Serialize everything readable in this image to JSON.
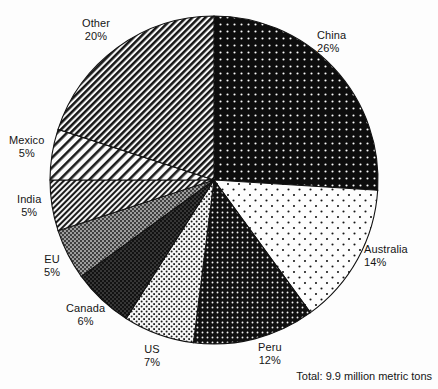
{
  "chart_data": {
    "type": "pie",
    "title": "",
    "subtitle": "",
    "xlabel": "",
    "ylabel": "",
    "legend_position": "none",
    "grid": false,
    "units": "percent of world total",
    "total_annotation": "Total: 9.9 million metric tons",
    "start_angle_deg": 0,
    "direction": "clockwise",
    "categories": [
      "China",
      "Australia",
      "Peru",
      "US",
      "Canada",
      "EU",
      "India",
      "Mexico",
      "Other"
    ],
    "values": [
      26,
      14,
      12,
      7,
      6,
      5,
      5,
      5,
      20
    ],
    "slices": [
      {
        "label": "China",
        "percent": 26,
        "percent_text": "26%",
        "fill": "black-dotted",
        "label_align": "left",
        "label_left": 317,
        "label_top": 29
      },
      {
        "label": "Australia",
        "percent": 14,
        "percent_text": "14%",
        "fill": "white-sparse-dotted",
        "label_align": "left",
        "label_left": 364,
        "label_top": 243
      },
      {
        "label": "Peru",
        "percent": 12,
        "percent_text": "12%",
        "fill": "black-dense-dotted",
        "label_align": "center",
        "label_left": 258,
        "label_top": 341
      },
      {
        "label": "US",
        "percent": 7,
        "percent_text": "7%",
        "fill": "light-dotted",
        "label_align": "center",
        "label_left": 144,
        "label_top": 343
      },
      {
        "label": "Canada",
        "percent": 6,
        "percent_text": "6%",
        "fill": "dark-crosshatch",
        "label_align": "center",
        "label_left": 66,
        "label_top": 302
      },
      {
        "label": "EU",
        "percent": 5,
        "percent_text": "5%",
        "fill": "gray-crosshatch",
        "label_align": "center",
        "label_left": 44,
        "label_top": 253
      },
      {
        "label": "India",
        "percent": 5,
        "percent_text": "5%",
        "fill": "fine-diagonal-hatch",
        "label_align": "center",
        "label_left": 17,
        "label_top": 193
      },
      {
        "label": "Mexico",
        "percent": 5,
        "percent_text": "5%",
        "fill": "wide-diagonal-hatch",
        "label_align": "center",
        "label_left": 9,
        "label_top": 134
      },
      {
        "label": "Other",
        "percent": 20,
        "percent_text": "20%",
        "fill": "dense-diagonal-hatch",
        "label_align": "center",
        "label_left": 82,
        "label_top": 17
      }
    ],
    "geometry": {
      "center_x": 214,
      "center_y": 180,
      "radius": 164
    },
    "colors": {
      "background": "#fdfdfd",
      "ink": "#151515",
      "outline": "#111111"
    }
  }
}
